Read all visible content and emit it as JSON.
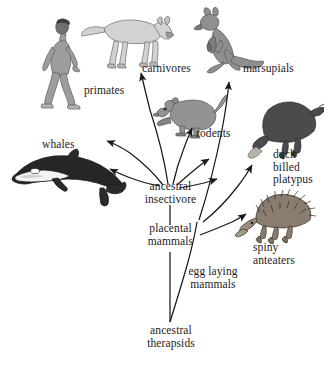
{
  "diagram": {
    "background_color": "#ffffff",
    "line_color": "#1a1a1a",
    "labels": {
      "primates": "primates",
      "carnivores": "carnivores",
      "marsupials": "marsupials",
      "rodents": "rodents",
      "whales": "whales",
      "duck_billed_platypus": "duck\nbilled\nplatypus",
      "spiny_anteaters": "spiny\nanteaters",
      "ancestral_insectivore": "ancestral\ninsectivore",
      "placental_mammals": "placental\nmammals",
      "egg_laying_mammals": "egg laying\nmammals",
      "ancestral_therapsids": "ancestral\ntherapsids"
    },
    "organisms": [
      {
        "name": "human",
        "label_key": "primates",
        "color": "#9a9a9a"
      },
      {
        "name": "wolf",
        "label_key": "carnivores",
        "color": "#cfcfcf"
      },
      {
        "name": "kangaroo",
        "label_key": "marsupials",
        "color": "#8e8e8e"
      },
      {
        "name": "rodent",
        "label_key": "rodents",
        "color": "#909090"
      },
      {
        "name": "orca",
        "label_key": "whales",
        "color": "#2a2a2a"
      },
      {
        "name": "platypus",
        "label_key": "duck_billed_platypus",
        "color": "#4a4a4a"
      },
      {
        "name": "echidna",
        "label_key": "spiny_anteaters",
        "color": "#7d7068"
      }
    ],
    "nodes": [
      {
        "name": "ancestral-therapsids",
        "label_key": "ancestral_therapsids"
      },
      {
        "name": "placental-mammals",
        "label_key": "placental_mammals"
      },
      {
        "name": "egg-laying-mammals",
        "label_key": "egg_laying_mammals"
      },
      {
        "name": "ancestral-insectivore",
        "label_key": "ancestral_insectivore"
      }
    ],
    "branches": [
      {
        "from": "ancestral-insectivore",
        "to": "primates"
      },
      {
        "from": "ancestral-insectivore",
        "to": "whales"
      },
      {
        "from": "ancestral-insectivore",
        "to": "carnivores"
      },
      {
        "from": "ancestral-insectivore",
        "to": "rodents"
      },
      {
        "from": "egg-laying-mammals",
        "to": "marsupials"
      },
      {
        "from": "egg-laying-mammals",
        "to": "duck-billed-platypus"
      },
      {
        "from": "egg-laying-mammals",
        "to": "spiny-anteaters"
      },
      {
        "from": "ancestral-therapsids",
        "to": "placental-mammals"
      },
      {
        "from": "ancestral-therapsids",
        "to": "egg-laying-mammals"
      }
    ]
  }
}
